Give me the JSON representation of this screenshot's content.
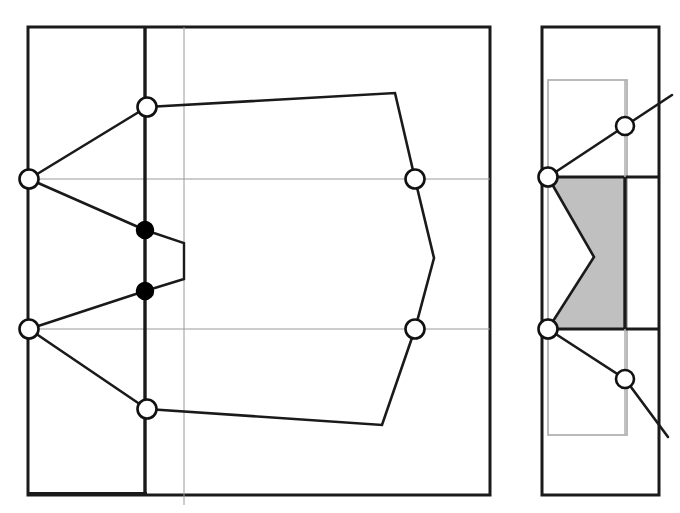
{
  "document": {
    "title": "Two-panel geometric cross-section line drawing",
    "type": "technical-line-diagram",
    "canvas": {
      "width": 680,
      "height": 513
    },
    "background_color": "#ffffff"
  },
  "colors": {
    "stroke_heavy": "#1a1a1a",
    "stroke_medium": "#222222",
    "stroke_thin_gray": "#9a9a9a",
    "stroke_light_gray": "#b3b3b3",
    "fill_gray": "#c0c0c0",
    "fill_white": "#ffffff",
    "node_open_fill": "#ffffff",
    "node_filled_fill": "#000000"
  },
  "stroke_widths": {
    "outer_frame": 3.0,
    "heavy_divider": 3.4,
    "polygon_outline": 2.6,
    "thin_grid": 1.0,
    "light_rect": 1.6,
    "node_ring": 2.4
  },
  "left_panel": {
    "name": "left-elevation-panel",
    "frame": {
      "x": 28,
      "y": 27,
      "width": 462,
      "height": 468
    },
    "vertical_divider_heavy": {
      "x": 145,
      "y1": 27,
      "y2": 495
    },
    "vertical_grid_thin": {
      "x": 184,
      "y1": 27,
      "y2": 505
    },
    "bottom_heavy_segment": {
      "x1": 28,
      "x2": 147,
      "y": 494
    },
    "horizontal_grid_lines": [
      {
        "name": "upper-centerline",
        "x1": 28,
        "x2": 490,
        "y": 179
      },
      {
        "name": "lower-centerline",
        "x1": 28,
        "x2": 490,
        "y": 329
      }
    ],
    "main_polygon": {
      "name": "main-outline-polygon",
      "points": "147,107 395,93 415,179 434,258 415,329 382,425 147,409"
    },
    "left_wing_upper": {
      "points": "29,179 147,107"
    },
    "left_wing_to_node_a": {
      "points": "29,179 145,230"
    },
    "left_wing_lower": {
      "points": "29,329 147,409"
    },
    "left_wing_to_node_b": {
      "points": "29,329 145,291"
    },
    "notch_shape": {
      "name": "center-notch",
      "points": "145,230 184,243 184,279 145,291"
    },
    "nodes": [
      {
        "name": "node-left-upper",
        "cx": 29,
        "cy": 179,
        "r": 9.5,
        "style": "open"
      },
      {
        "name": "node-left-lower",
        "cx": 29,
        "cy": 329,
        "r": 9.5,
        "style": "open"
      },
      {
        "name": "node-top-divider",
        "cx": 147,
        "cy": 107,
        "r": 9.5,
        "style": "open"
      },
      {
        "name": "node-bottom-divider",
        "cx": 147,
        "cy": 409,
        "r": 9.5,
        "style": "open"
      },
      {
        "name": "node-notch-upper",
        "cx": 145,
        "cy": 230,
        "r": 8.5,
        "style": "filled"
      },
      {
        "name": "node-notch-lower",
        "cx": 145,
        "cy": 291,
        "r": 8.5,
        "style": "filled"
      },
      {
        "name": "node-right-upper",
        "cx": 415,
        "cy": 179,
        "r": 9.5,
        "style": "open"
      },
      {
        "name": "node-right-lower",
        "cx": 415,
        "cy": 329,
        "r": 9.5,
        "style": "open"
      }
    ]
  },
  "right_panel": {
    "name": "right-section-panel",
    "frame": {
      "x": 542,
      "y": 27,
      "width": 117,
      "height": 468
    },
    "inner_light_rect": {
      "x": 548,
      "y": 80,
      "width": 79,
      "height": 355
    },
    "gray_block": {
      "name": "shaded-core-block",
      "x": 548,
      "y": 177,
      "width": 77,
      "height": 152,
      "fill": "#c0c0c0"
    },
    "gray_zigzag": {
      "name": "zigzag-boundary",
      "points": "548,177 594,257 548,329"
    },
    "heavy_vertical_divider": {
      "x": 625,
      "y1": 177,
      "y2": 329
    },
    "horizontal_lines": [
      {
        "name": "upper-section-line",
        "x1": 548,
        "x2": 659,
        "y": 177
      },
      {
        "name": "lower-section-line",
        "x1": 548,
        "x2": 659,
        "y": 329
      }
    ],
    "diagonals": [
      {
        "name": "upper-diagonal",
        "points": "548,177 625,126 672,95"
      },
      {
        "name": "lower-diagonal",
        "points": "548,329 625,379 668,437"
      }
    ],
    "nodes": [
      {
        "name": "node-section-left-upper",
        "cx": 548,
        "cy": 177,
        "r": 9.5,
        "style": "open"
      },
      {
        "name": "node-section-left-lower",
        "cx": 548,
        "cy": 329,
        "r": 9.5,
        "style": "open"
      },
      {
        "name": "node-section-right-upper",
        "cx": 625,
        "cy": 126,
        "r": 9.0,
        "style": "open"
      },
      {
        "name": "node-section-right-lower",
        "cx": 625,
        "cy": 379,
        "r": 9.0,
        "style": "open"
      }
    ]
  }
}
